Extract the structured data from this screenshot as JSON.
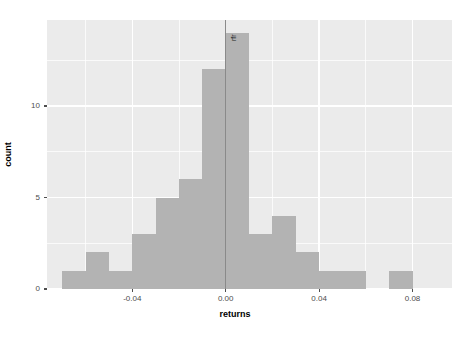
{
  "chart_data": {
    "type": "bar",
    "subtype": "histogram",
    "title": "",
    "xlabel": "returns",
    "ylabel": "count",
    "xlim": [
      -0.0765,
      0.0969
    ],
    "ylim": [
      0,
      14.7
    ],
    "xticks": [
      -0.04,
      0.0,
      0.04,
      0.08
    ],
    "xtick_labels": [
      "-0.04",
      "0.00",
      "0.04",
      "0.08"
    ],
    "yticks": [
      0,
      5,
      10
    ],
    "ytick_labels": [
      "0",
      "5",
      "10"
    ],
    "grid": true,
    "grid_major_color": "#ffffff",
    "grid_minor_color": "#ffffff",
    "panel_color": "#ebebeb",
    "bar_color": "#b3b3b3",
    "legend": "none",
    "bin_width": 0.01,
    "bin_starts": [
      -0.07,
      -0.06,
      -0.05,
      -0.04,
      -0.03,
      -0.02,
      -0.01,
      0.0,
      0.01,
      0.02,
      0.03,
      0.04,
      0.05,
      0.07
    ],
    "bin_ends": [
      -0.06,
      -0.05,
      -0.04,
      -0.03,
      -0.02,
      -0.01,
      0.0,
      0.01,
      0.02,
      0.03,
      0.04,
      0.05,
      0.06,
      0.08
    ],
    "values": [
      1,
      2,
      1,
      3,
      5,
      6,
      12,
      14,
      3,
      4,
      2,
      1,
      1,
      1
    ],
    "categories": [
      "-0.07",
      "-0.06",
      "-0.05",
      "-0.04",
      "-0.03",
      "-0.02",
      "-0.01",
      "0.00",
      "0.01",
      "0.02",
      "0.03",
      "0.04",
      "0.05",
      "0.07"
    ],
    "annotations": [
      {
        "name": "rfr",
        "label": "rfr",
        "type": "vline",
        "x": 0.0,
        "color": "#8a8a8a"
      }
    ]
  }
}
